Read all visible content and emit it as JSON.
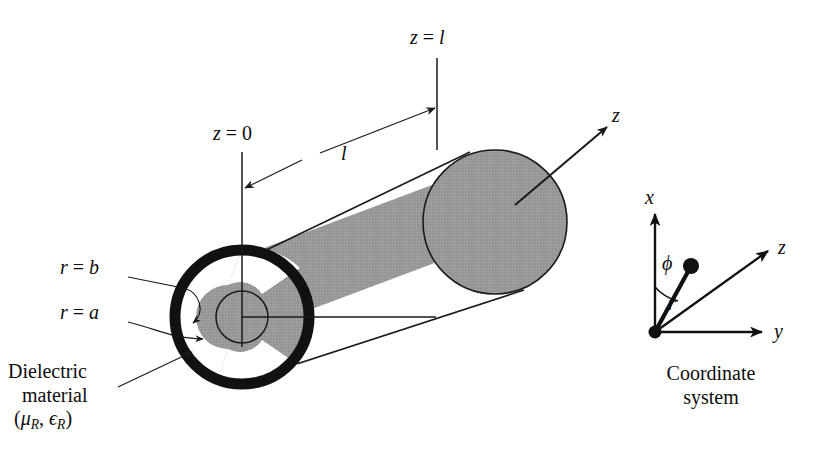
{
  "figure": {
    "colors": {
      "cylinder_gray": "#9a9a9a",
      "conductor_black": "#111111",
      "line_black": "#1a1a1a",
      "background": "#ffffff",
      "text": "#0d0d0d"
    }
  },
  "labels": {
    "z_zero": {
      "var": "z",
      "eq": " = ",
      "value": "0"
    },
    "z_ell": {
      "var": "z",
      "eq": " = ",
      "value": "l"
    },
    "length": "l",
    "z_axis": "z",
    "r_equals_b": {
      "var": "r",
      "eq": " = ",
      "value": "b"
    },
    "r_equals_a": {
      "var": "r",
      "eq": " = ",
      "value": "a"
    },
    "dielectric_line1": "Dielectric",
    "dielectric_line2": "material",
    "dielectric_params": {
      "open": "(",
      "mu": "μ",
      "mu_sub": "R",
      "comma": ", ",
      "eps": "ϵ",
      "eps_sub": "R",
      "close": ")"
    }
  },
  "coordinate_system": {
    "caption_line1": "Coordinate",
    "caption_line2": "system",
    "axis_x": "x",
    "axis_y": "y",
    "axis_z": "z",
    "angle_phi": "ϕ",
    "radius_r": "r"
  }
}
